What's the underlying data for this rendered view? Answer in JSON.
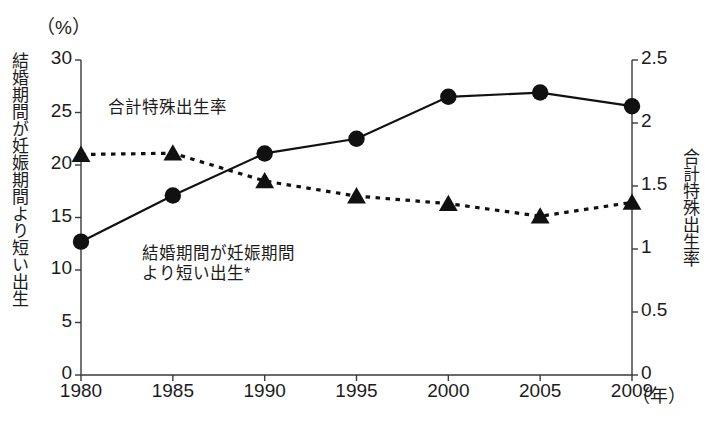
{
  "chart_data": {
    "type": "line",
    "title": "",
    "subtitle": "",
    "x": [
      "1980",
      "1985",
      "1990",
      "1995",
      "2000",
      "2005",
      "2009"
    ],
    "xlabel": "",
    "x_unit": "（年）",
    "left_axis": {
      "label": "結婚期間が妊娠期間より短い出生",
      "unit": "（%）",
      "ticks": [
        "0",
        "5",
        "10",
        "15",
        "20",
        "25",
        "30"
      ],
      "tick_values": [
        0,
        5,
        10,
        15,
        20,
        25,
        30
      ],
      "ylim": [
        0,
        30
      ]
    },
    "right_axis": {
      "label": "合計特殊出生率",
      "ticks": [
        "0",
        "0.5",
        "1",
        "1.5",
        "2",
        "2.5"
      ],
      "tick_values": [
        0,
        0.5,
        1,
        1.5,
        2,
        2.5
      ],
      "ylim": [
        0,
        2.5
      ]
    },
    "grid": false,
    "legend": "in-plot-annotations",
    "series": [
      {
        "name": "結婚期間が妊娠期間より短い出生",
        "axis": "left",
        "marker": "circle",
        "line_style": "solid",
        "color": "#111111",
        "values": [
          12.7,
          17.1,
          21.1,
          22.5,
          26.5,
          26.9,
          25.6
        ]
      },
      {
        "name": "合計特殊出生率",
        "axis": "right",
        "marker": "triangle",
        "line_style": "dashed",
        "color": "#111111",
        "values": [
          1.75,
          1.76,
          1.54,
          1.42,
          1.36,
          1.26,
          1.37
        ]
      }
    ],
    "annotations": [
      {
        "text": "合計特殊出生率",
        "x_px": 108,
        "y_px": 97
      },
      {
        "text": "結婚期間が妊娠期間",
        "x_px": 142,
        "y_px": 243
      },
      {
        "text": "より短い出生*",
        "x_px": 142,
        "y_px": 263
      }
    ]
  },
  "labels": {
    "pct_unit": "（%）",
    "left_axis_title": "結婚期間が妊娠期間より短い出生",
    "right_axis_title": "合計特殊出生率",
    "x_unit": "（年）",
    "anno_tfr": "合計特殊出生率",
    "anno_pre_line1": "結婚期間が妊娠期間",
    "anno_pre_line2": "より短い出生*"
  },
  "yticks_left": [
    "30",
    "25",
    "20",
    "15",
    "10",
    "5",
    "0"
  ],
  "yticks_right": [
    "2.5",
    "2",
    "1.5",
    "1",
    "0.5",
    "0"
  ],
  "xticks": [
    "1980",
    "1985",
    "1990",
    "1995",
    "2000",
    "2005",
    "2009"
  ],
  "footnote": {
    "text": ""
  }
}
